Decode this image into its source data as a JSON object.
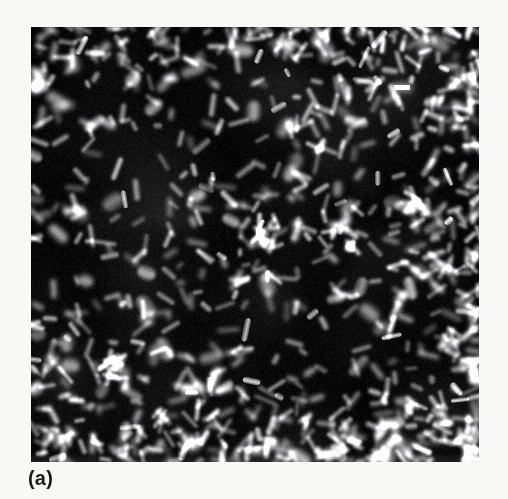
{
  "figure": {
    "panel_label": "(a)",
    "kind": "fluorescence-micrograph",
    "background_color": "#f8f8f6",
    "plate_background_color": "#050505",
    "cell_color": "#c8c8c8",
    "highlight_color": "#ffffff"
  },
  "plate": {
    "left": 31,
    "top": 27,
    "width": 448,
    "height": 435
  },
  "chart_data": {
    "type": "heatmap",
    "title": "(a)",
    "xlabel": "",
    "ylabel": "",
    "note": "Grayscale epifluorescence micrograph: bright stained cells on black field",
    "intensity_range": [
      0,
      255
    ],
    "background_intensity": 6,
    "cell_intensity_mean": 150,
    "brightest_feature_intensity": 255,
    "approx_cell_count": 620,
    "morphology_mix": {
      "rods": 0.82,
      "ovals": 0.15,
      "clusters": 0.03
    },
    "brightest_feature": {
      "x": 394,
      "y": 85,
      "w": 16,
      "h": 5
    }
  }
}
